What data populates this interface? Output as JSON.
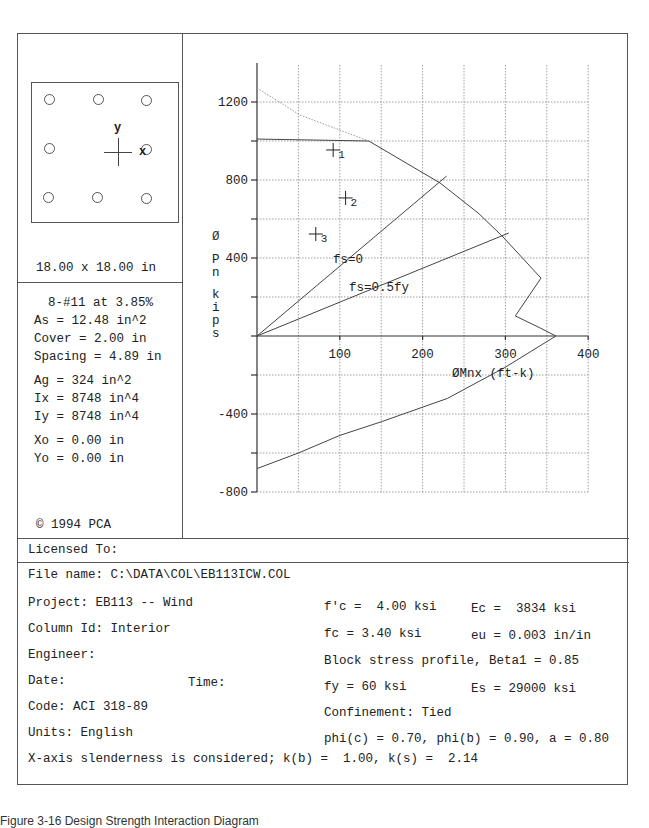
{
  "section": {
    "dimensions": "18.00 x 18.00 in",
    "axis_x": "x",
    "axis_y": "y",
    "bars": [
      {
        "row": 0,
        "col": 0
      },
      {
        "row": 0,
        "col": 1
      },
      {
        "row": 0,
        "col": 2
      },
      {
        "row": 1,
        "col": 0
      },
      {
        "row": 1,
        "col": 2
      },
      {
        "row": 2,
        "col": 0
      },
      {
        "row": 2,
        "col": 1
      },
      {
        "row": 2,
        "col": 2
      }
    ]
  },
  "properties": {
    "reinforcement": "8-#11 at 3.85%",
    "as": "As = 12.48 in^2",
    "cover": "Cover = 2.00 in",
    "spacing": "Spacing = 4.89 in",
    "ag": "Ag = 324 in^2",
    "ix": "Ix = 8748 in^4",
    "iy": "Iy = 8748 in^4",
    "xo": "Xo = 0.00 in",
    "yo": "Yo = 0.00 in"
  },
  "copyright": "© 1994 PCA",
  "licensed_to": "Licensed To:",
  "info": {
    "file_name": "File name: C:\\DATA\\COL\\EB113ICW.COL",
    "project": "Project: EB113 -- Wind",
    "column_id": "Column Id: Interior",
    "engineer": "Engineer:",
    "date": "Date:",
    "time": "Time:",
    "code": "Code: ACI 318-89",
    "units": "Units: English",
    "slenderness": "X-axis slenderness is considered; k(b) =  1.00, k(s) =  2.14",
    "fpc": "f'c =  4.00 ksi",
    "ec": "Ec =  3834 ksi",
    "fc": "fc = 3.40 ksi",
    "eu": "eu = 0.003 in/in",
    "block": "Block stress profile, Beta1 = 0.85",
    "fy": "fy = 60 ksi",
    "es": "Es = 29000 ksi",
    "confinement": "Confinement: Tied",
    "phi": "phi(c) = 0.70, phi(b) = 0.90, a = 0.80"
  },
  "caption": "Figure 3-16 Design Strength Interaction Diagram",
  "chart_data": {
    "type": "line",
    "title": "",
    "xlabel": "ØMnx (ft-k)",
    "ylabel": "Ø Pn kips",
    "xlim": [
      0,
      400
    ],
    "ylim": [
      -800,
      1400
    ],
    "x_ticks": [
      100,
      200,
      300,
      400
    ],
    "y_ticks": [
      1200,
      800,
      400,
      -400,
      -800
    ],
    "grid": true,
    "series": [
      {
        "name": "design strength (phi Pn - phi Mn)",
        "style": "solid",
        "points": [
          [
            0,
            1010
          ],
          [
            135,
            1000
          ],
          [
            221,
            785
          ],
          [
            267,
            631
          ],
          [
            296,
            513
          ],
          [
            343,
            297
          ],
          [
            312,
            103
          ],
          [
            342,
            41
          ],
          [
            361,
            0
          ],
          [
            300,
            -160
          ],
          [
            230,
            -320
          ],
          [
            150,
            -440
          ],
          [
            100,
            -510
          ],
          [
            50,
            -600
          ],
          [
            0,
            -680
          ]
        ]
      },
      {
        "name": "nominal (unreduced max axial)",
        "style": "dotted",
        "points": [
          [
            0,
            1272
          ],
          [
            52,
            1133
          ],
          [
            135,
            1000
          ]
        ]
      },
      {
        "name": "fs=0",
        "style": "solid",
        "label": "fs=0",
        "points": [
          [
            0,
            0
          ],
          [
            229,
            820
          ]
        ]
      },
      {
        "name": "fs=0.5fy",
        "style": "solid",
        "label": "fs=0.5fy",
        "points": [
          [
            0,
            0
          ],
          [
            304,
            528
          ]
        ]
      }
    ],
    "load_points": [
      {
        "label": "1",
        "M": 92,
        "P": 954
      },
      {
        "label": "2",
        "M": 107,
        "P": 708
      },
      {
        "label": "3",
        "M": 71,
        "P": 523
      }
    ]
  }
}
